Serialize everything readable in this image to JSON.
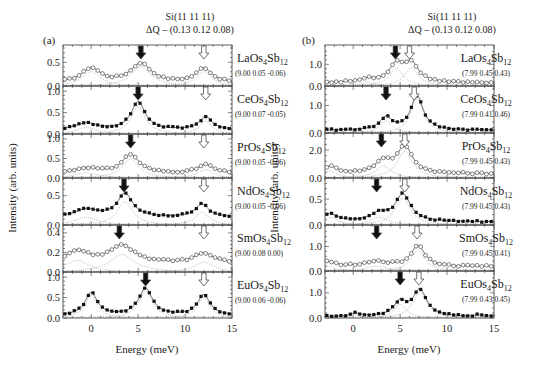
{
  "chart_data": [
    {
      "panel": "a",
      "type": "scatter",
      "panel_label": "(a)",
      "header_line1": "Si(11 11 11)",
      "header_line2": "ΔQ – (0.13 0.12 0.08)",
      "xlabel": "Energy  (meV)",
      "ylabel": "Intensity  (arb. units)",
      "xlim": [
        -3,
        15
      ],
      "xticks": [
        0,
        5,
        10,
        15
      ],
      "arrows": "filled arrow marks lower mode, open arrow marks upper mode",
      "series": [
        {
          "compound": "LaOs4Sb12",
          "name_base": "LaOs",
          "sub1": "4",
          "mid": "Sb",
          "sub2": "12",
          "q": "(9.00 0.05 -0.06)",
          "marker": "open",
          "ylim": [
            0,
            0.8
          ],
          "yticks": [
            "0.0",
            "0.5"
          ],
          "filled_arrow": 5.3,
          "open_arrow": 12.0,
          "peaks": [
            {
              "x": 0.0,
              "h": 0.3,
              "w": 1.2
            },
            {
              "x": 5.3,
              "h": 0.4,
              "w": 1.3
            },
            {
              "x": 12.0,
              "h": 0.3,
              "w": 1.0
            }
          ],
          "base": 0.07
        },
        {
          "compound": "CeOs4Sb12",
          "name_base": "CeOs",
          "sub1": "4",
          "mid": "Sb",
          "sub2": "12",
          "q": "(9.00 0.07 -0.05)",
          "marker": "filled",
          "ylim": [
            0,
            1.05
          ],
          "yticks": [
            "0.0",
            "0.5",
            "1.0"
          ],
          "filled_arrow": 5.0,
          "open_arrow": 12.2,
          "peaks": [
            {
              "x": -0.5,
              "h": 0.15,
              "w": 1.3
            },
            {
              "x": 5.0,
              "h": 0.65,
              "w": 0.9
            },
            {
              "x": 12.2,
              "h": 0.3,
              "w": 0.8
            }
          ],
          "base": 0.1
        },
        {
          "compound": "PrOs4Sb12",
          "name_base": "PrOs",
          "sub1": "4",
          "mid": "Sb",
          "sub2": "12",
          "q": "(9.00 0.05 -0.06)",
          "marker": "open",
          "ylim": [
            0,
            1.05
          ],
          "yticks": [
            "0.0",
            "0.5",
            "1.0"
          ],
          "filled_arrow": 4.2,
          "open_arrow": 12.0,
          "peaks": [
            {
              "x": -0.5,
              "h": 0.13,
              "w": 1.5
            },
            {
              "x": 4.2,
              "h": 0.48,
              "w": 1.1
            },
            {
              "x": 12.2,
              "h": 0.22,
              "w": 1.0
            }
          ],
          "base": 0.12
        },
        {
          "compound": "NdOs4Sb12",
          "name_base": "NdOs",
          "sub1": "4",
          "mid": "Sb",
          "sub2": "12",
          "q": "(9.00 0.05 -0.06)",
          "marker": "filled",
          "ylim": [
            0,
            0.75
          ],
          "yticks": [
            "0.0",
            "0.5"
          ],
          "filled_arrow": 3.5,
          "open_arrow": 12.0,
          "peaks": [
            {
              "x": -0.5,
              "h": 0.13,
              "w": 1.5
            },
            {
              "x": 3.6,
              "h": 0.4,
              "w": 1.0
            },
            {
              "x": 11.8,
              "h": 0.22,
              "w": 0.9
            }
          ],
          "base": 0.13
        },
        {
          "compound": "SmOs4Sb12",
          "name_base": "SmOs",
          "sub1": "4",
          "mid": "Sb",
          "sub2": "12",
          "q": "(9.00 0.08 0.00)",
          "marker": "open",
          "ylim": [
            0,
            0.45
          ],
          "yticks": [
            "0.0",
            "0.2",
            "0.4"
          ],
          "filled_arrow": 3.0,
          "open_arrow": 12.0,
          "peaks": [
            {
              "x": -1.5,
              "h": 0.12,
              "w": 1.5
            },
            {
              "x": 3.3,
              "h": 0.18,
              "w": 1.6
            },
            {
              "x": 12.0,
              "h": 0.1,
              "w": 1.2
            }
          ],
          "base": 0.09
        },
        {
          "compound": "EuOs4Sb12",
          "name_base": "EuOs",
          "sub1": "4",
          "mid": "Sb",
          "sub2": "12",
          "q": "(9.00 0.06 -0.06)",
          "marker": "filled",
          "ylim": [
            0,
            1.05
          ],
          "yticks": [
            "0.0",
            "0.5",
            "1.0"
          ],
          "filled_arrow": 5.8,
          "open_arrow": 12.0,
          "peaks": [
            {
              "x": 0.0,
              "h": 0.55,
              "w": 0.8
            },
            {
              "x": 5.8,
              "h": 0.65,
              "w": 0.9
            },
            {
              "x": 12.0,
              "h": 0.5,
              "w": 0.8
            }
          ],
          "base": 0.06
        }
      ]
    },
    {
      "panel": "b",
      "type": "scatter",
      "panel_label": "(b)",
      "header_line1": "Si(11 11 11)",
      "header_line2": "ΔQ – (0.13 0.12 0.08)",
      "xlabel": "Energy  (meV)",
      "ylabel": "Intensity  (arb. units)",
      "xlim": [
        -3,
        15
      ],
      "xticks": [
        0,
        5,
        10,
        15
      ],
      "series": [
        {
          "compound": "LaOs4Sb12",
          "name_base": "LaOs",
          "sub1": "4",
          "mid": "Sb",
          "sub2": "12",
          "q": "(7.99 0.45 0.43)",
          "marker": "open",
          "ylim": [
            0,
            1.75
          ],
          "yticks": [
            "0.0",
            "1.0"
          ],
          "filled_arrow": 4.5,
          "open_arrow": 6.0,
          "peaks": [
            {
              "x": 1.5,
              "h": 0.15,
              "w": 1.2
            },
            {
              "x": 4.6,
              "h": 0.8,
              "w": 0.9
            },
            {
              "x": 6.2,
              "h": 0.85,
              "w": 0.9
            }
          ],
          "base": 0.15
        },
        {
          "compound": "CeOs4Sb12",
          "name_base": "CeOs",
          "sub1": "4",
          "mid": "Sb",
          "sub2": "12",
          "q": "(7.99 0.41 0.46)",
          "marker": "filled",
          "ylim": [
            0,
            1.6
          ],
          "yticks": [
            "0.0",
            "1.0"
          ],
          "filled_arrow": 3.5,
          "open_arrow": 6.5,
          "peaks": [
            {
              "x": 3.5,
              "h": 0.45,
              "w": 0.8
            },
            {
              "x": 6.8,
              "h": 1.25,
              "w": 0.8
            }
          ],
          "base": 0.1
        },
        {
          "compound": "PrOs4Sb12",
          "name_base": "PrOs",
          "sub1": "4",
          "mid": "Sb",
          "sub2": "12",
          "q": "(7.99 0.45 0.43)",
          "marker": "open",
          "ylim": [
            0,
            3.0
          ],
          "yticks": [
            "0.0",
            "2.0"
          ],
          "filled_arrow": 3.0,
          "open_arrow": 5.5,
          "peaks": [
            {
              "x": -2.5,
              "h": 0.5,
              "w": 1.0
            },
            {
              "x": 3.2,
              "h": 0.85,
              "w": 1.0
            },
            {
              "x": 5.5,
              "h": 1.9,
              "w": 1.0
            }
          ],
          "base": 0.3
        },
        {
          "compound": "NdOs4Sb12",
          "name_base": "NdOs",
          "sub1": "4",
          "mid": "Sb",
          "sub2": "12",
          "q": "(7.99 0.45 0.43)",
          "marker": "filled",
          "ylim": [
            0,
            0.85
          ],
          "yticks": [
            "0.0",
            "0.5"
          ],
          "filled_arrow": 2.5,
          "open_arrow": 5.5,
          "peaks": [
            {
              "x": -2.5,
              "h": 0.15,
              "w": 1.0
            },
            {
              "x": 2.8,
              "h": 0.15,
              "w": 1.1
            },
            {
              "x": 5.3,
              "h": 0.52,
              "w": 1.0
            }
          ],
          "base": 0.06
        },
        {
          "compound": "SmOs4Sb12",
          "name_base": "SmOs",
          "sub1": "4",
          "mid": "Sb",
          "sub2": "12",
          "q": "(7.99 0.45 0.41)",
          "marker": "open",
          "ylim": [
            0,
            1.75
          ],
          "yticks": [
            "0.0",
            "1.0"
          ],
          "filled_arrow": 2.5,
          "open_arrow": 6.8,
          "peaks": [
            {
              "x": -2.8,
              "h": 0.2,
              "w": 1.0
            },
            {
              "x": 2.5,
              "h": 0.2,
              "w": 1.4
            },
            {
              "x": 6.9,
              "h": 0.85,
              "w": 0.9
            }
          ],
          "base": 0.18
        },
        {
          "compound": "EuOs4Sb12",
          "name_base": "EuOs",
          "sub1": "4",
          "mid": "Sb",
          "sub2": "12",
          "q": "(7.99 0.43 0.45)",
          "marker": "filled",
          "ylim": [
            0,
            1.75
          ],
          "yticks": [
            "0.0",
            "1.0"
          ],
          "filled_arrow": 5.0,
          "open_arrow": 7.0,
          "peaks": [
            {
              "x": 0.2,
              "h": 0.12,
              "w": 0.7
            },
            {
              "x": 5.0,
              "h": 0.55,
              "w": 0.8
            },
            {
              "x": 7.1,
              "h": 1.05,
              "w": 0.9
            },
            {
              "x": 13.5,
              "h": 0.05,
              "w": 0.8
            }
          ],
          "base": 0.05
        }
      ]
    }
  ]
}
